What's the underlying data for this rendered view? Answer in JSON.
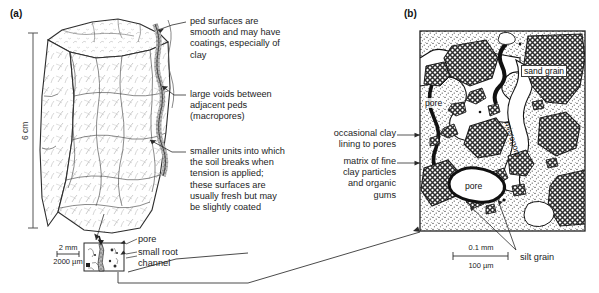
{
  "figure": {
    "panels": [
      {
        "letter": "(a)",
        "name": "soil-ped-block"
      },
      {
        "letter": "(b)",
        "name": "soil-thin-section"
      }
    ]
  },
  "panel_a": {
    "letter": "(a)",
    "vertical_scale": "6 cm",
    "callouts": [
      {
        "id": "ped-surfaces",
        "text": "ped surfaces are\nsmooth and may have\ncoatings, especially of\nclay"
      },
      {
        "id": "large-voids",
        "text": "large voids between\nadjacent peds\n(macropores)"
      },
      {
        "id": "smaller-units",
        "text": "smaller units into which\nthe soil breaks when\ntension is applied;\nthese surfaces are\nusually fresh but may\nbe slightly coated"
      }
    ],
    "inset": {
      "scale_top": "2 mm",
      "scale_bottom": "2000 µm",
      "labels": [
        {
          "id": "pore",
          "text": "pore"
        },
        {
          "id": "small-root-channel",
          "text": "small root\nchannel"
        }
      ]
    }
  },
  "panel_b": {
    "letter": "(b)",
    "scale_top": "0.1 mm",
    "scale_bottom": "100 µm",
    "internal_labels": [
      {
        "id": "sand-grain",
        "text": "sand grain"
      },
      {
        "id": "pore-upper-left",
        "text": "pore"
      },
      {
        "id": "pore-lower",
        "text": "pore"
      },
      {
        "id": "micropore",
        "text": "micropore"
      }
    ],
    "callouts": [
      {
        "id": "occasional-clay-lining",
        "text": "occasional clay\nlining to pores"
      },
      {
        "id": "matrix-of-fine-clay",
        "text": "matrix of fine\nclay particles\nand organic\ngums"
      },
      {
        "id": "silt-grain",
        "text": "silt grain"
      }
    ]
  },
  "colors": {
    "ink": "#1b1b1b",
    "line": "#3a3a3a",
    "sand_fill": "#8d8d8d",
    "matrix_fill": "#cfcfcf",
    "pore_fill": "#ffffff",
    "background": "#ffffff"
  }
}
